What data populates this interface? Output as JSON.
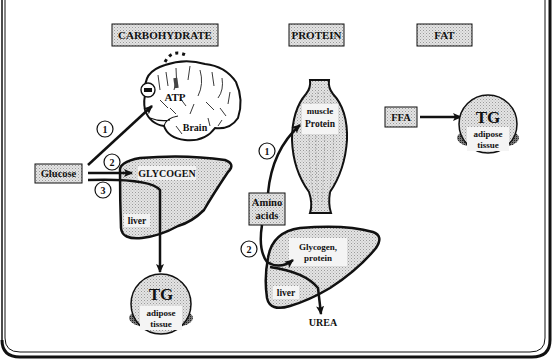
{
  "headers": {
    "carbohydrate": "CARBOHYDRATE",
    "protein": "PROTEIN",
    "fat": "FAT"
  },
  "carbohydrate": {
    "source": "Glucose",
    "brain_label": "Brain",
    "atp_label": "ATP",
    "inhibit_symbol": "−",
    "glycogen_label": "GLYCOGEN",
    "liver_label": "liver",
    "tg_label": "TG",
    "adipose_line1": "adipose",
    "adipose_line2": "tissue",
    "pathways": [
      "1",
      "2",
      "3"
    ]
  },
  "protein": {
    "source_line1": "Amino",
    "source_line2": "acids",
    "muscle_label": "muscle",
    "muscle_protein_label": "Protein",
    "liver_product_line1": "Glycogen,",
    "liver_product_line2": "protein",
    "liver_label": "liver",
    "excretion_label": "UREA",
    "pathways": [
      "1",
      "2"
    ]
  },
  "fat": {
    "source": "FFA",
    "tg_label": "TG",
    "adipose_line1": "adipose",
    "adipose_line2": "tissue"
  },
  "colors": {
    "box_fill": "#d4d4d4",
    "organ_fill": "#d8d8d8",
    "stroke": "#111111",
    "background": "#ffffff"
  }
}
